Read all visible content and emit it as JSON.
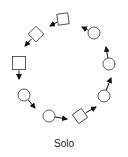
{
  "caption": "Solo",
  "colors": {
    "stroke": "#333333",
    "fill": "#ffffff",
    "arrow": "#111111"
  },
  "nodes": [
    {
      "id": "n1",
      "shape": "square",
      "cx": 63,
      "cy": 19,
      "size": 11,
      "rotate": -8,
      "arrow_to": [
        50,
        26
      ]
    },
    {
      "id": "n2",
      "shape": "square",
      "cx": 36,
      "cy": 34,
      "size": 11,
      "rotate": 45,
      "arrow_to": [
        25,
        46
      ]
    },
    {
      "id": "n3",
      "shape": "square",
      "cx": 19,
      "cy": 63,
      "size": 13,
      "rotate": 0,
      "arrow_to": [
        19,
        79
      ]
    },
    {
      "id": "n4",
      "shape": "circle",
      "cx": 24,
      "cy": 95,
      "r": 6,
      "arrow_to": [
        35,
        108
      ]
    },
    {
      "id": "n5",
      "shape": "circle",
      "cx": 49,
      "cy": 116,
      "r": 6,
      "arrow_to": [
        67,
        119
      ]
    },
    {
      "id": "n6",
      "shape": "square",
      "cx": 80,
      "cy": 116,
      "size": 11,
      "rotate": -35,
      "arrow_to": [
        96,
        107
      ]
    },
    {
      "id": "n7",
      "shape": "circle",
      "cx": 104,
      "cy": 96,
      "r": 6,
      "arrow_to": [
        111,
        78
      ]
    },
    {
      "id": "n8",
      "shape": "circle",
      "cx": 109,
      "cy": 64,
      "r": 6,
      "arrow_to": [
        106,
        47
      ]
    },
    {
      "id": "n9",
      "shape": "circle",
      "cx": 94,
      "cy": 33,
      "r": 6,
      "arrow_to": [
        82,
        27
      ]
    }
  ]
}
